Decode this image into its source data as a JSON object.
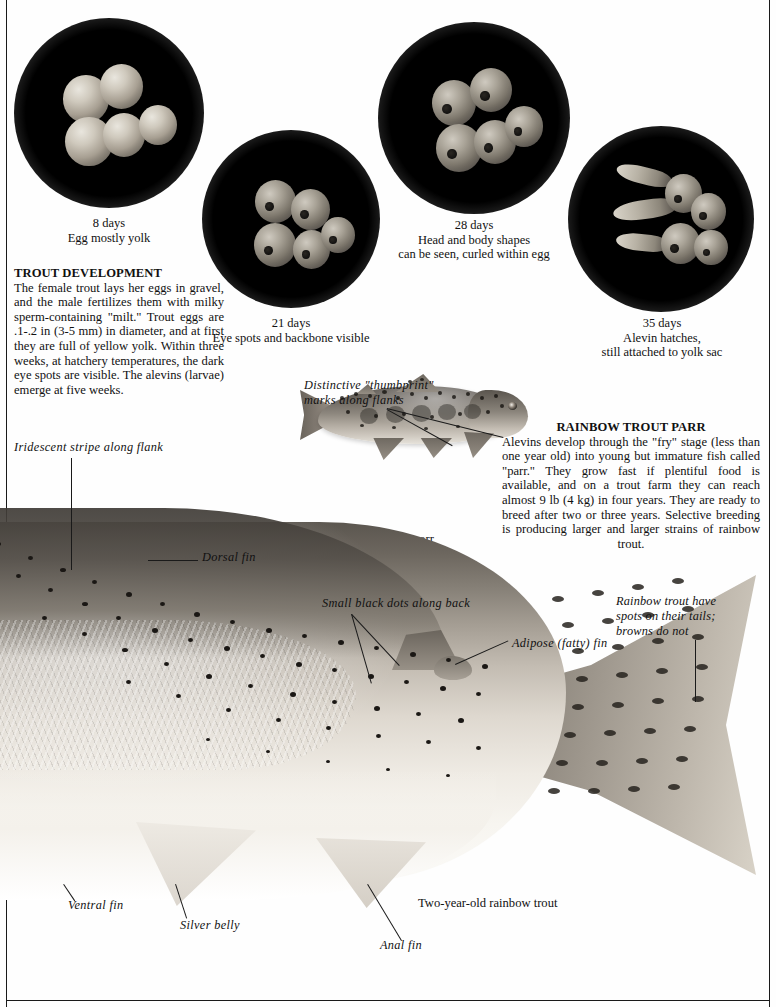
{
  "egg_stages": [
    {
      "id": "stage-8-days",
      "day_label": "8 days",
      "description": "Egg mostly yolk"
    },
    {
      "id": "stage-21-days",
      "day_label": "21 days",
      "description": "Eye spots and backbone visible"
    },
    {
      "id": "stage-28-days",
      "day_label": "28 days",
      "description_line1": "Head and body shapes",
      "description_line2": "can be seen, curled within egg"
    },
    {
      "id": "stage-35-days",
      "day_label": "35 days",
      "description_line1": "Alevin hatches,",
      "description_line2": "still attached to yolk sac"
    }
  ],
  "trout_development": {
    "heading": "TROUT DEVELOPMENT",
    "body": "The female trout lays her eggs in gravel, and the male fertilizes them with milky sperm-containing \"milt.\" Trout eggs are .1-.2 in (3-5 mm) in diameter, and at first they are full of yellow yolk. Within three weeks, at hatchery temperatures, the dark eye spots are visible. The alevins (larvae) emerge at five weeks."
  },
  "rainbow_trout_parr": {
    "heading": "RAINBOW TROUT PARR",
    "body": "Alevins develop through the \"fry\" stage (less than one year old) into young but immature fish called \"parr.\" They grow fast if plentiful food is available, and on a trout farm they can reach almost 9 lb (4 kg) in four years. They are ready to breed after two or three years. Selective breeding is producing larger and larger strains of rainbow trout."
  },
  "annotations": {
    "thumbprint_line1": "Distinctive  \"thumbprint\"",
    "thumbprint_line2": "marks  along  flanks",
    "parr_caption": "Rainbow trout parr",
    "iridescent_stripe": "Iridescent  stripe  along  flank",
    "dorsal_fin": "Dorsal  fin",
    "small_black_dots": "Small  black  dots  along  back",
    "adipose_fin": "Adipose  (fatty)  fin",
    "tail_spots_line1": "Rainbow  trout  have",
    "tail_spots_line2": "spots  on  their  tails;",
    "tail_spots_line3": "browns  do  not",
    "ventral_fin": "Ventral  fin",
    "silver_belly": "Silver  belly",
    "anal_fin": "Anal  fin",
    "main_caption": "Two-year-old rainbow trout"
  },
  "colors": {
    "ink": "#111111",
    "paper": "#fefefe",
    "photo_black": "#000000",
    "egg_highlight": "#e9e6de"
  }
}
